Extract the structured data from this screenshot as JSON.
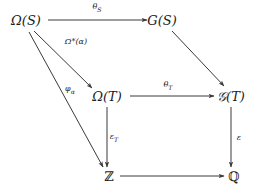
{
  "diagram": {
    "background_color": "#ffffff",
    "line_color": "#3a3a3a",
    "text_color": "#1a1a1a",
    "nodes": [
      {
        "id": "omega-s",
        "label": "Ω(S)",
        "x": 26,
        "y": 20
      },
      {
        "id": "g-s",
        "label": "G(S)",
        "x": 162,
        "y": 20
      },
      {
        "id": "omega-t",
        "label": "Ω(T)",
        "x": 107,
        "y": 96
      },
      {
        "id": "script-g-t",
        "label": "𝒢(T)",
        "x": 231,
        "y": 96
      },
      {
        "id": "integers",
        "label": "ℤ",
        "x": 109,
        "y": 176
      },
      {
        "id": "rationals",
        "label": "ℚ",
        "x": 234,
        "y": 176
      }
    ],
    "arrows": [
      {
        "id": "theta-s",
        "from": "omega-s",
        "to": "g-s",
        "label": "θ",
        "sub": "S",
        "label_x": 97,
        "label_y": 8
      },
      {
        "id": "omega-star-alpha",
        "from": "omega-s",
        "to": "omega-t",
        "label": "Ω*(α)",
        "sub": "",
        "label_x": 76,
        "label_y": 42
      },
      {
        "id": "phi-alpha",
        "from": "omega-s",
        "to": "integers",
        "label": "φ",
        "sub": "α",
        "label_x": 70,
        "label_y": 90
      },
      {
        "id": "g-s-to-script-g-t",
        "from": "g-s",
        "to": "script-g-t",
        "label": "",
        "sub": "",
        "label_x": 0,
        "label_y": 0
      },
      {
        "id": "theta-t",
        "from": "omega-t",
        "to": "script-g-t",
        "label": "θ",
        "sub": "T",
        "label_x": 168,
        "label_y": 86
      },
      {
        "id": "epsilon-t",
        "from": "omega-t",
        "to": "integers",
        "label": "ε",
        "sub": "T",
        "label_x": 114,
        "label_y": 138
      },
      {
        "id": "epsilon",
        "from": "script-g-t",
        "to": "rationals",
        "label": "ε",
        "sub": "",
        "label_x": 239,
        "label_y": 138
      },
      {
        "id": "integers-to-rationals",
        "from": "integers",
        "to": "rationals",
        "label": "",
        "sub": "",
        "label_x": 0,
        "label_y": 0
      }
    ]
  }
}
